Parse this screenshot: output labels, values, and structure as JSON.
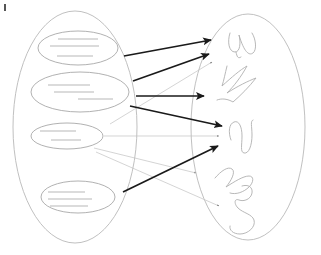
{
  "diagram": {
    "corner_mark": {
      "name": "corner-tick",
      "x1": 5,
      "y1": 4,
      "x2": 5,
      "y2": 11
    },
    "sets": [
      {
        "id": "left-set",
        "label": "documents-set",
        "cx": 75,
        "cy": 127,
        "rx": 62,
        "ry": 116
      },
      {
        "id": "right-set",
        "label": "shapes-set",
        "cx": 248,
        "cy": 127,
        "rx": 57,
        "ry": 113
      }
    ],
    "documents": [
      {
        "id": "doc-1",
        "label": "document-item-1",
        "cx": 78,
        "cy": 48,
        "rx": 40,
        "ry": 17,
        "lines": [
          {
            "x1": 58,
            "y1": 39,
            "x2": 98,
            "y2": 39
          },
          {
            "x1": 50,
            "y1": 46,
            "x2": 99,
            "y2": 46
          },
          {
            "x1": 57,
            "y1": 56,
            "x2": 93,
            "y2": 56
          }
        ]
      },
      {
        "id": "doc-2",
        "label": "document-item-2",
        "cx": 80,
        "cy": 92,
        "rx": 49,
        "ry": 20,
        "lines": [
          {
            "x1": 48,
            "y1": 85,
            "x2": 90,
            "y2": 85
          },
          {
            "x1": 54,
            "y1": 92,
            "x2": 94,
            "y2": 92
          },
          {
            "x1": 78,
            "y1": 99,
            "x2": 113,
            "y2": 99
          }
        ]
      },
      {
        "id": "doc-3",
        "label": "document-item-3",
        "cx": 67,
        "cy": 136,
        "rx": 36,
        "ry": 13,
        "lines": [
          {
            "x1": 40,
            "y1": 131,
            "x2": 76,
            "y2": 131
          },
          {
            "x1": 51,
            "y1": 140,
            "x2": 81,
            "y2": 140
          }
        ]
      },
      {
        "id": "doc-4",
        "label": "document-item-4",
        "cx": 78,
        "cy": 197,
        "rx": 37,
        "ry": 16,
        "lines": [
          {
            "x1": 48,
            "y1": 192,
            "x2": 85,
            "y2": 192
          },
          {
            "x1": 48,
            "y1": 199,
            "x2": 92,
            "y2": 199
          },
          {
            "x1": 50,
            "y1": 206,
            "x2": 88,
            "y2": 206
          }
        ]
      }
    ],
    "shapes": [
      {
        "id": "shape-1",
        "label": "double-loop-squiggle"
      },
      {
        "id": "shape-2",
        "label": "zigzag-squiggle"
      },
      {
        "id": "shape-3",
        "label": "n-curve-squiggle"
      },
      {
        "id": "shape-4",
        "label": "wave-squiggle"
      },
      {
        "id": "shape-5",
        "label": "s-curl-squiggle"
      }
    ],
    "arrows_strong": [
      {
        "id": "arrow-1",
        "label": "mapping-arrow-1",
        "from": "doc-1",
        "to": "shape-1",
        "x1": 124,
        "y1": 56,
        "x2": 211,
        "y2": 40
      },
      {
        "id": "arrow-2",
        "label": "mapping-arrow-2",
        "from": "doc-2",
        "to": "shape-1b",
        "x1": 133,
        "y1": 81,
        "x2": 209,
        "y2": 54
      },
      {
        "id": "arrow-3",
        "label": "mapping-arrow-3",
        "from": "doc-2",
        "to": "shape-2",
        "x1": 136,
        "y1": 96,
        "x2": 204,
        "y2": 96
      },
      {
        "id": "arrow-4",
        "label": "mapping-arrow-4",
        "from": "doc-2",
        "to": "shape-3",
        "x1": 130,
        "y1": 106,
        "x2": 222,
        "y2": 126
      },
      {
        "id": "arrow-5",
        "label": "mapping-arrow-5",
        "from": "doc-4",
        "to": "shape-3b",
        "x1": 123,
        "y1": 192,
        "x2": 218,
        "y2": 146
      }
    ],
    "arrows_weak": [
      {
        "id": "thin-arrow-1",
        "label": "weak-mapping-arrow-1",
        "x1": 110,
        "y1": 124,
        "x2": 212,
        "y2": 62
      },
      {
        "id": "thin-arrow-2",
        "label": "weak-mapping-arrow-2",
        "x1": 104,
        "y1": 136,
        "x2": 219,
        "y2": 136
      },
      {
        "id": "thin-arrow-3",
        "label": "weak-mapping-arrow-3",
        "x1": 94,
        "y1": 148,
        "x2": 196,
        "y2": 173
      },
      {
        "id": "thin-arrow-4",
        "label": "weak-mapping-arrow-4",
        "x1": 96,
        "y1": 152,
        "x2": 219,
        "y2": 206
      }
    ],
    "colors": {
      "background": "#ffffff",
      "set_outline": "#b9b9b9",
      "item_outline": "#a8a8a8",
      "text_line": "#cfcfcf",
      "squiggle": "#b0b0b0",
      "arrow_strong": "#1a1a1a",
      "arrow_weak": "#c2c2c2"
    }
  }
}
